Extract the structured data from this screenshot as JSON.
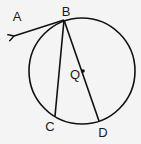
{
  "diagram": {
    "circle": {
      "center": "Q",
      "cx": 82,
      "cy": 71,
      "r": 53
    },
    "points": {
      "A": {
        "label": "A",
        "x": 13,
        "y": 36,
        "lx": 17,
        "ly": 20
      },
      "B": {
        "label": "B",
        "x": 64,
        "y": 20,
        "lx": 66,
        "ly": 15
      },
      "C": {
        "label": "C",
        "x": 55,
        "y": 116,
        "lx": 50,
        "ly": 131
      },
      "D": {
        "label": "D",
        "x": 99,
        "y": 121,
        "lx": 103,
        "ly": 137
      },
      "Q": {
        "label": "Q",
        "x": 83,
        "y": 71,
        "lx": 74,
        "ly": 79
      }
    },
    "segments": [
      {
        "name": "ray-BA",
        "from": "B",
        "to": "A",
        "arrow": true
      },
      {
        "name": "chord-BC",
        "from": "B",
        "to": "C"
      },
      {
        "name": "diameter-BD",
        "from": "B",
        "to": "D"
      }
    ],
    "stroke_color": "#111111",
    "background": "#f4f4f4"
  }
}
